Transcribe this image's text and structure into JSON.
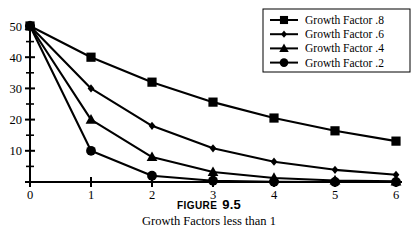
{
  "figure": {
    "caption_label": "FIGURE",
    "caption_number": "9.5",
    "caption_title": "Growth Factors less than 1"
  },
  "legend": {
    "position": "top-right",
    "border_color": "#000000",
    "items": [
      {
        "label": "Growth Factor .8",
        "marker": "square",
        "color": "#000000"
      },
      {
        "label": "Growth Factor .6",
        "marker": "diamond",
        "color": "#000000"
      },
      {
        "label": "Growth Factor .4",
        "marker": "triangle",
        "color": "#000000"
      },
      {
        "label": "Growth Factor .2",
        "marker": "circle",
        "color": "#000000"
      }
    ]
  },
  "axes": {
    "x_ticks": [
      "0",
      "1",
      "2",
      "3",
      "4",
      "5",
      "6"
    ],
    "y_ticks": [
      "0",
      "10",
      "20",
      "30",
      "40",
      "50"
    ],
    "y_minor_ticks": [
      "5",
      "15",
      "25",
      "35",
      "45"
    ]
  },
  "chart_data": {
    "type": "line",
    "title": "Growth Factors less than 1",
    "xlabel": "",
    "ylabel": "",
    "xlim": [
      0,
      6
    ],
    "ylim": [
      0,
      50
    ],
    "grid": false,
    "legend_position": "top-right",
    "x": [
      0,
      1,
      2,
      3,
      4,
      5,
      6
    ],
    "series": [
      {
        "name": "Growth Factor .8",
        "marker": "square",
        "color": "#000000",
        "values": [
          50,
          40,
          32,
          25.6,
          20.5,
          16.4,
          13.1
        ]
      },
      {
        "name": "Growth Factor .6",
        "marker": "diamond",
        "color": "#000000",
        "values": [
          50,
          30,
          18,
          10.8,
          6.5,
          3.9,
          2.3
        ]
      },
      {
        "name": "Growth Factor .4",
        "marker": "triangle",
        "color": "#000000",
        "values": [
          50,
          20,
          8,
          3.2,
          1.3,
          0.5,
          0.2
        ]
      },
      {
        "name": "Growth Factor .2",
        "marker": "circle",
        "color": "#000000",
        "values": [
          50,
          10,
          2,
          0.4,
          0.08,
          0.016,
          0.003
        ]
      }
    ]
  }
}
